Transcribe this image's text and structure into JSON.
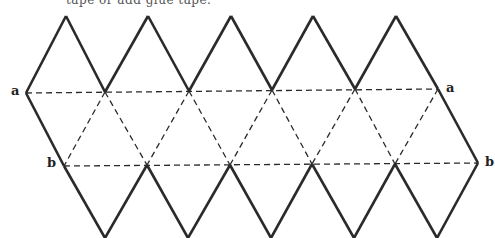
{
  "caption": "tape or add glue tape.",
  "diagram": {
    "labels": {
      "a_left": "a",
      "a_right": "a",
      "b_left": "b",
      "b_right": "b"
    },
    "row_a_y": 91,
    "row_b_y": 165,
    "top_peaks": [
      [
        66,
        16
      ],
      [
        148,
        16
      ],
      [
        231,
        16
      ],
      [
        313,
        16
      ],
      [
        396,
        16
      ]
    ],
    "row_a_points": [
      [
        26,
        93
      ],
      [
        105,
        92
      ],
      [
        189,
        91
      ],
      [
        272,
        90
      ],
      [
        355,
        89
      ],
      [
        438,
        89
      ]
    ],
    "row_b_points": [
      [
        64,
        166
      ],
      [
        147,
        165
      ],
      [
        230,
        165
      ],
      [
        312,
        164
      ],
      [
        395,
        164
      ],
      [
        478,
        163
      ]
    ],
    "bottom_points": [
      [
        105,
        238
      ],
      [
        188,
        238
      ],
      [
        271,
        238
      ],
      [
        354,
        238
      ],
      [
        437,
        238
      ]
    ],
    "line_color": "#2a2a2a",
    "fold_style": "dashed"
  }
}
